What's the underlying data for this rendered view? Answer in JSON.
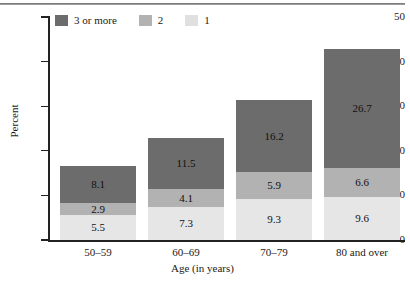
{
  "chart_data": {
    "type": "bar",
    "stacked": true,
    "title": "",
    "xlabel": "Age (in years)",
    "ylabel": "Percent",
    "categories": [
      "50–59",
      "60–69",
      "70–79",
      "80 and over"
    ],
    "ylim": [
      0,
      50
    ],
    "ytick_labels": [
      "0",
      "10",
      "20",
      "30",
      "40",
      "50"
    ],
    "ytick_values": [
      0,
      10,
      20,
      30,
      40,
      50
    ],
    "grid": false,
    "legend_position": "top-left",
    "series": [
      {
        "name": "1",
        "key": "s1",
        "color": "#e6e6e6",
        "values": [
          5.5,
          7.3,
          9.3,
          9.6
        ],
        "labels": [
          "5.5",
          "7.3",
          "9.3",
          "9.6"
        ]
      },
      {
        "name": "2",
        "key": "s2",
        "color": "#b2b2b2",
        "values": [
          2.9,
          4.1,
          5.9,
          6.6
        ],
        "labels": [
          "2.9",
          "4.1",
          "5.9",
          "6.6"
        ]
      },
      {
        "name": "3 or more",
        "key": "s3",
        "color": "#6c6c6c",
        "values": [
          8.1,
          11.5,
          16.2,
          26.7
        ],
        "labels": [
          "8.1",
          "11.5",
          "16.2",
          "26.7"
        ]
      }
    ],
    "totals": [
      16.5,
      22.9,
      31.4,
      42.9
    ]
  },
  "legend": {
    "items": [
      {
        "label": "3 or more",
        "swatch": "s3"
      },
      {
        "label": "2",
        "swatch": "s2"
      },
      {
        "label": "1",
        "swatch": "s1"
      }
    ]
  },
  "axes": {
    "y": {
      "title": "Percent",
      "ticks": [
        "50",
        "40",
        "30",
        "20",
        "10",
        "0"
      ]
    },
    "x": {
      "title": "Age (in years)",
      "ticks": [
        "50–59",
        "60–69",
        "70–79",
        "80 and over"
      ]
    }
  }
}
